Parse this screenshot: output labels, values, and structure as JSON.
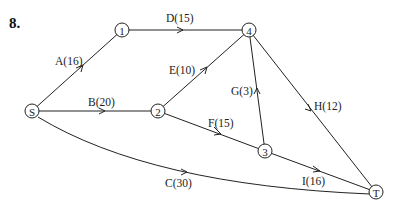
{
  "problem": {
    "number": "8."
  },
  "nodes": [
    {
      "id": "S",
      "label": "S",
      "x": 32,
      "y": 111
    },
    {
      "id": "1",
      "label": "1",
      "x": 122,
      "y": 30
    },
    {
      "id": "2",
      "label": "2",
      "x": 158,
      "y": 111
    },
    {
      "id": "3",
      "label": "3",
      "x": 265,
      "y": 151
    },
    {
      "id": "4",
      "label": "4",
      "x": 249,
      "y": 30
    },
    {
      "id": "T",
      "label": "T",
      "x": 376,
      "y": 192
    }
  ],
  "edges": [
    {
      "id": "A",
      "from": "S",
      "to": "1",
      "weight": 16,
      "label": "A(16)"
    },
    {
      "id": "B",
      "from": "S",
      "to": "2",
      "weight": 20,
      "label": "B(20)"
    },
    {
      "id": "C",
      "from": "S",
      "to": "T",
      "weight": 30,
      "label": "C(30)"
    },
    {
      "id": "D",
      "from": "1",
      "to": "4",
      "weight": 15,
      "label": "D(15)"
    },
    {
      "id": "E",
      "from": "2",
      "to": "4",
      "weight": 10,
      "label": "E(10)"
    },
    {
      "id": "F",
      "from": "2",
      "to": "3",
      "weight": 15,
      "label": "F(15)"
    },
    {
      "id": "G",
      "from": "3",
      "to": "4",
      "weight": 3,
      "label": "G(3)"
    },
    {
      "id": "H",
      "from": "4",
      "to": "T",
      "weight": 12,
      "label": "H(12)"
    },
    {
      "id": "I",
      "from": "3",
      "to": "T",
      "weight": 16,
      "label": "I(16)"
    }
  ]
}
